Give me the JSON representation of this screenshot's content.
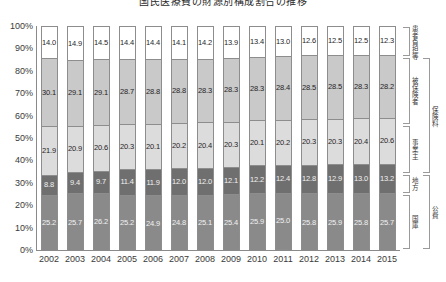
{
  "chart_data": {
    "type": "bar",
    "stacked": true,
    "normalized_percent": true,
    "title": "国民医療費の財源別構成割合の推移",
    "xlabel": "",
    "ylabel": "",
    "ylim": [
      0,
      100
    ],
    "ytick_labels": [
      "100%",
      "90%",
      "80%",
      "70%",
      "60%",
      "50%",
      "40%",
      "30%",
      "20%",
      "10%",
      "0%"
    ],
    "ytick_values": [
      100,
      90,
      80,
      70,
      60,
      50,
      40,
      30,
      20,
      10,
      0
    ],
    "grid": false,
    "legend_position": "right",
    "categories": [
      "2002",
      "2003",
      "2004",
      "2005",
      "2006",
      "2007",
      "2008",
      "2009",
      "2010",
      "2011",
      "2012",
      "2013",
      "2014",
      "2015"
    ],
    "stack_order_top_to_bottom": [
      "患者負担等",
      "被保険者",
      "事業主",
      "地方",
      "国庫"
    ],
    "series": [
      {
        "name": "患者負担等",
        "color": "#ffffff",
        "label_on_dark": false,
        "values": [
          14.0,
          14.9,
          14.5,
          14.4,
          14.4,
          14.1,
          14.2,
          13.9,
          13.4,
          13.0,
          12.6,
          12.5,
          12.5,
          12.3
        ]
      },
      {
        "name": "被保険者",
        "color": "#c9c9c9",
        "label_on_dark": false,
        "values": [
          30.1,
          29.1,
          29.1,
          28.7,
          28.8,
          28.8,
          28.3,
          28.3,
          28.3,
          28.4,
          28.5,
          28.5,
          28.3,
          28.2
        ]
      },
      {
        "name": "事業主",
        "color": "#dcdcdc",
        "label_on_dark": false,
        "values": [
          21.9,
          20.9,
          20.6,
          20.3,
          20.1,
          20.2,
          20.4,
          20.3,
          20.1,
          20.2,
          20.3,
          20.3,
          20.4,
          20.6
        ]
      },
      {
        "name": "地方",
        "color": "#6f6f6f",
        "label_on_dark": true,
        "values": [
          8.8,
          9.4,
          9.7,
          11.4,
          11.9,
          12.0,
          12.0,
          12.1,
          12.2,
          12.4,
          12.8,
          12.9,
          13.0,
          13.2
        ]
      },
      {
        "name": "国庫",
        "color": "#8a8a8a",
        "label_on_dark": true,
        "values": [
          25.2,
          25.7,
          26.2,
          25.2,
          24.9,
          24.8,
          25.1,
          25.4,
          25.9,
          25.0,
          25.8,
          25.9,
          25.8,
          25.7
        ]
      }
    ],
    "legend_brackets": {
      "inner": [
        {
          "label": "患者負担等",
          "from_series": "患者負担等",
          "to_series": "患者負担等"
        },
        {
          "label": "被保険者",
          "from_series": "被保険者",
          "to_series": "被保険者"
        },
        {
          "label": "事業主",
          "from_series": "事業主",
          "to_series": "事業主"
        },
        {
          "label": "地方",
          "from_series": "地方",
          "to_series": "地方"
        },
        {
          "label": "国庫",
          "from_series": "国庫",
          "to_series": "国庫"
        }
      ],
      "outer": [
        {
          "label": "保険料",
          "from_series": "被保険者",
          "to_series": "事業主"
        },
        {
          "label": "公費",
          "from_series": "地方",
          "to_series": "国庫"
        }
      ]
    }
  },
  "colors": {
    "axis": "#8a8a8a",
    "bar_border": "#8d8d8d",
    "text": "#3a3a3a"
  }
}
